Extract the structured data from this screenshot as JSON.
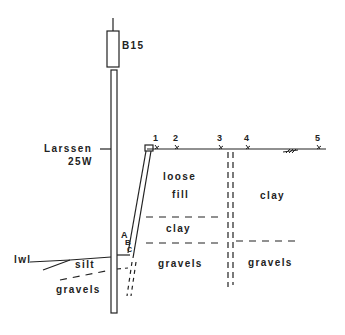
{
  "diagram": {
    "type": "geotechnical cross-section",
    "hammer_label": "B15",
    "pile_label_line1": "Larssen",
    "pile_label_line2": "25W",
    "water_level_label": "lwl",
    "measurement_points": [
      "1",
      "2",
      "3",
      "4",
      "5"
    ],
    "strut_points": [
      "A",
      "B",
      "C"
    ],
    "soil_layers": {
      "left_upper": "silt",
      "left_lower": "gravels",
      "middle_top_line1": "loose",
      "middle_top_line2": "fill",
      "middle_mid": "clay",
      "middle_bottom": "gravels",
      "right_top": "clay",
      "right_bottom": "gravels"
    },
    "colors": {
      "ink": "#222222",
      "background": "#ffffff"
    }
  }
}
